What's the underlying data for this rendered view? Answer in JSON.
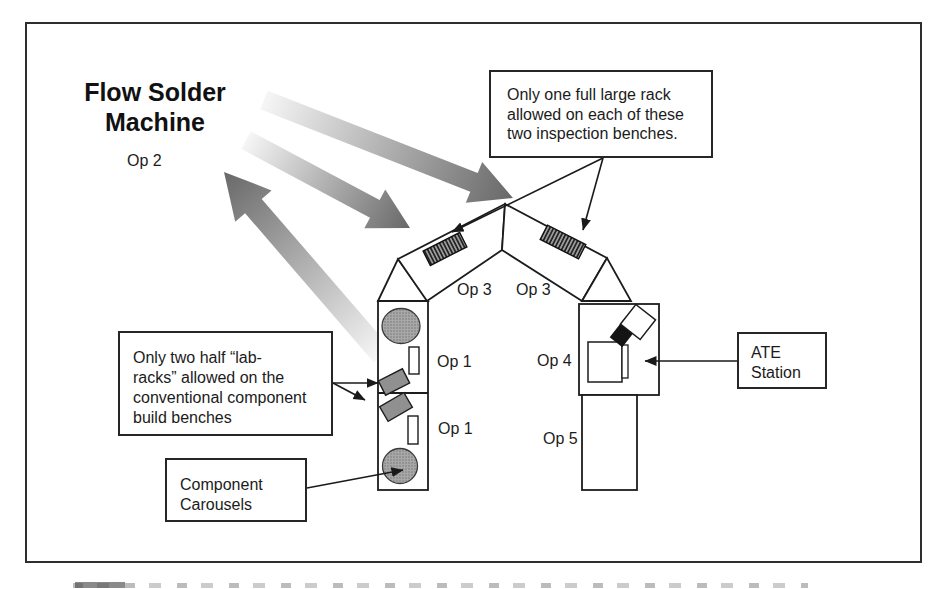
{
  "diagram": {
    "title": "Flow Solder\nMachine",
    "labels": {
      "op2": "Op 2",
      "op3_left": "Op 3",
      "op3_right": "Op 3",
      "op1_top": "Op 1",
      "op1_bottom": "Op 1",
      "op4": "Op 4",
      "op5": "Op 5"
    },
    "notes": {
      "inspection": "Only one full large rack\nallowed on each of these\ntwo inspection benches.",
      "lab_racks": "Only two half “lab-\nracks” allowed on the\nconventional component\nbuild benches",
      "carousels": "Component\nCarousels",
      "ate": "ATE\nStation"
    },
    "icons": {
      "flow_arrows": "gradient-flow-arrow",
      "pointer_arrows": "black-pointer-arrow"
    },
    "colors": {
      "ink": "#1c1c1c",
      "frame_border": "#2e2e2e",
      "arrow_gradient_light": "#f6f6f6",
      "arrow_gradient_dark": "#686868",
      "equipment_gray": "#909090",
      "carousel_gray": "#a8a8a8",
      "rack_dark": "#222222",
      "background": "#ffffff"
    }
  }
}
